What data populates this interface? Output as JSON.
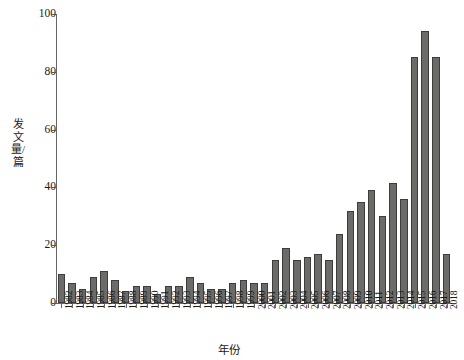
{
  "chart_data": {
    "type": "bar",
    "title": "",
    "subtitle": "",
    "xlabel": "年份",
    "ylabel": "发文量/篇",
    "grid": false,
    "legend": false,
    "legend_position": "none",
    "bar_color": "#6b6b68",
    "bar_edge_color": "#3d3d3b",
    "axis_color": "#666666",
    "ylim": [
      0,
      100
    ],
    "yticks": [
      0,
      20,
      40,
      60,
      80,
      100
    ],
    "ytick_labels": [
      "0",
      "20",
      "40",
      "60",
      "80",
      "100"
    ],
    "categories": [
      "1982",
      "1983",
      "1984",
      "1985",
      "1986",
      "1987",
      "1988",
      "1989",
      "1990",
      "1991",
      "1992",
      "1993",
      "1994",
      "1995",
      "1996",
      "1997",
      "1998",
      "1999",
      "2000",
      "2001",
      "2002",
      "2003",
      "2004",
      "2005",
      "2006",
      "2007",
      "2008",
      "2009",
      "2010",
      "2011",
      "2012",
      "2013",
      "2014",
      "2015",
      "2016",
      "2017",
      "2018"
    ],
    "values": [
      10,
      7,
      5,
      9,
      11,
      8,
      4,
      6,
      6,
      3,
      6,
      6,
      9,
      7,
      5,
      5,
      7,
      8,
      7,
      7,
      15,
      19,
      15,
      16,
      17,
      15,
      24,
      32,
      35,
      39,
      30,
      41.5,
      36,
      85,
      94,
      85,
      17
    ]
  }
}
